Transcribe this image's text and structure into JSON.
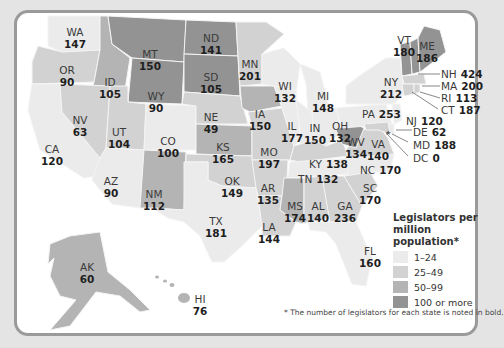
{
  "legend": {
    "title": "Legislators per million population*",
    "items": [
      {
        "label": "1–24",
        "color": "#ebebeb"
      },
      {
        "label": "25–49",
        "color": "#d2d2d2"
      },
      {
        "label": "50–99",
        "color": "#b4b4b4"
      },
      {
        "label": "100 or more",
        "color": "#939393"
      }
    ]
  },
  "footnote": "* The number of legislators for each state is noted in bold.",
  "states": [
    {
      "abbr": "WA",
      "count": "147"
    },
    {
      "abbr": "OR",
      "count": "90"
    },
    {
      "abbr": "CA",
      "count": "120"
    },
    {
      "abbr": "ID",
      "count": "105"
    },
    {
      "abbr": "NV",
      "count": "63"
    },
    {
      "abbr": "MT",
      "count": "150"
    },
    {
      "abbr": "WY",
      "count": "90"
    },
    {
      "abbr": "UT",
      "count": "104"
    },
    {
      "abbr": "AZ",
      "count": "90"
    },
    {
      "abbr": "CO",
      "count": "100"
    },
    {
      "abbr": "NM",
      "count": "112"
    },
    {
      "abbr": "ND",
      "count": "141"
    },
    {
      "abbr": "SD",
      "count": "105"
    },
    {
      "abbr": "NE",
      "count": "49"
    },
    {
      "abbr": "KS",
      "count": "165"
    },
    {
      "abbr": "OK",
      "count": "149"
    },
    {
      "abbr": "TX",
      "count": "181"
    },
    {
      "abbr": "MN",
      "count": "201"
    },
    {
      "abbr": "IA",
      "count": "150"
    },
    {
      "abbr": "MO",
      "count": "197"
    },
    {
      "abbr": "AR",
      "count": "135"
    },
    {
      "abbr": "LA",
      "count": "144"
    },
    {
      "abbr": "WI",
      "count": "132"
    },
    {
      "abbr": "IL",
      "count": "177"
    },
    {
      "abbr": "MI",
      "count": "148"
    },
    {
      "abbr": "IN",
      "count": "150"
    },
    {
      "abbr": "OH",
      "count": "132"
    },
    {
      "abbr": "KY",
      "count": "138"
    },
    {
      "abbr": "TN",
      "count": "132"
    },
    {
      "abbr": "MS",
      "count": "174"
    },
    {
      "abbr": "AL",
      "count": "140"
    },
    {
      "abbr": "GA",
      "count": "236"
    },
    {
      "abbr": "FL",
      "count": "160"
    },
    {
      "abbr": "SC",
      "count": "170"
    },
    {
      "abbr": "NC",
      "count": "170"
    },
    {
      "abbr": "VA",
      "count": "140"
    },
    {
      "abbr": "WV",
      "count": "134"
    },
    {
      "abbr": "PA",
      "count": "253"
    },
    {
      "abbr": "NY",
      "count": "212"
    },
    {
      "abbr": "VT",
      "count": "180"
    },
    {
      "abbr": "ME",
      "count": "186"
    },
    {
      "abbr": "NH",
      "count": "424"
    },
    {
      "abbr": "MA",
      "count": "200"
    },
    {
      "abbr": "RI",
      "count": "113"
    },
    {
      "abbr": "CT",
      "count": "187"
    },
    {
      "abbr": "NJ",
      "count": "120"
    },
    {
      "abbr": "DE",
      "count": "62"
    },
    {
      "abbr": "MD",
      "count": "188"
    },
    {
      "abbr": "DC",
      "count": "0"
    },
    {
      "abbr": "AK",
      "count": "60"
    },
    {
      "abbr": "HI",
      "count": "76"
    }
  ]
}
